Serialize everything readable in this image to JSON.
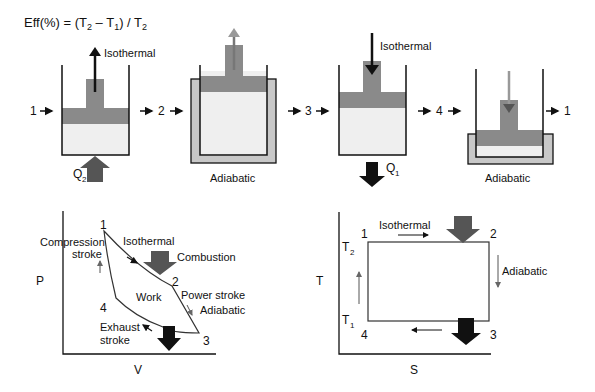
{
  "formula": {
    "prefix": "Eff(%) = (T",
    "sub_a": "2",
    "mid": " – T",
    "sub_b": "1",
    "mid2": ") / T",
    "sub_c": "2"
  },
  "cylinders": {
    "labels": {
      "iso1": "Isothermal",
      "adi1": "Adiabatic",
      "iso2": "Isothermal",
      "adi2": "Adiabatic"
    },
    "heat_in": {
      "q": "Q",
      "sub": "2"
    },
    "heat_out": {
      "q": "Q",
      "sub": "1"
    },
    "sequence": [
      "1",
      "2",
      "3",
      "4",
      "1"
    ]
  },
  "pv": {
    "xlabel": "V",
    "ylabel": "P",
    "points": [
      "1",
      "2",
      "3",
      "4"
    ],
    "labels": {
      "compression1": "Compression",
      "compression2": "stroke",
      "isothermal": "Isothermal",
      "combustion": "Combustion",
      "work": "Work",
      "power": "Power stroke",
      "adiabatic": "Adiabatic",
      "exhaust1": "Exhaust",
      "exhaust2": "stroke"
    }
  },
  "ts": {
    "xlabel": "S",
    "ylabel": "T",
    "points": [
      "1",
      "2",
      "3",
      "4"
    ],
    "t2": {
      "t": "T",
      "sub": "2"
    },
    "t1": {
      "t": "T",
      "sub": "1"
    },
    "labels": {
      "isothermal": "Isothermal",
      "adiabatic": "Adiabatic"
    }
  },
  "colors": {
    "piston": "#8a8a8a",
    "gas": "#efefef",
    "insulation": "#c8c8c8",
    "dark_arrow": "#555555",
    "black": "#111111"
  }
}
